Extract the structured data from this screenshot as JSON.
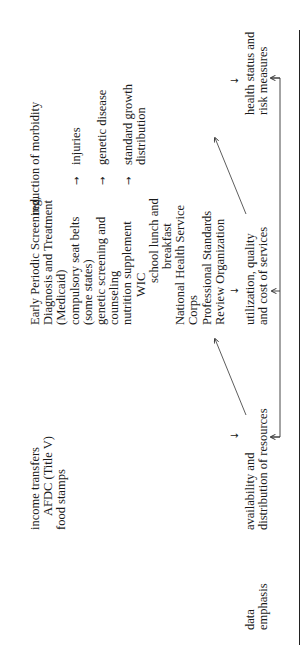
{
  "diagram": {
    "row_label": [
      "data",
      "emphasis"
    ],
    "programs": {
      "income": [
        "income transfers",
        "AFDC (Title V)",
        "food stamps"
      ],
      "services": [
        "Early Periodic Screening,",
        "Diagnosis and Treatment",
        "(Medicaid)",
        "compulsory seat belts",
        "(some states)",
        "genetic screening and",
        "counseling",
        "nutrition supplement",
        "WIC",
        "school lunch and",
        "breakfast",
        "National Health Service",
        "Corps",
        "Professional Standards",
        "Review Organization"
      ]
    },
    "outcomes": {
      "morbidity": "reduction of morbidity",
      "injuries": "injuries",
      "genetic": "genetic disease",
      "growth": [
        "standard growth",
        "distribution"
      ]
    },
    "data_emphasis": {
      "resources": [
        "availability and",
        "distribution of resources"
      ],
      "utilization": [
        "utilization, quality",
        "and cost of services"
      ],
      "health": [
        "health status and",
        "risk measures"
      ]
    },
    "arrows": {
      "right": "→",
      "down": "↓",
      "up": "↑"
    }
  }
}
